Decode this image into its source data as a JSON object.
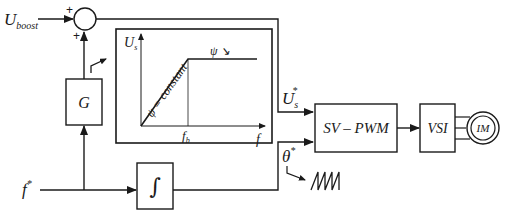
{
  "diagram": {
    "inputs": {
      "u_boost": {
        "main": "U",
        "sub": "boost"
      },
      "f_ref": {
        "main": "f",
        "sup": "*"
      }
    },
    "sum_signs": {
      "top": "+",
      "left": "+"
    },
    "blocks": {
      "gain": "G",
      "integrator": "∫",
      "svpwm": "SV – PWM",
      "vsi": "VSI",
      "motor": "IM"
    },
    "signals": {
      "us_ref": {
        "main": "U",
        "sub": "s",
        "sup": "*"
      },
      "theta_ref": {
        "main": "θ",
        "sup": "*"
      }
    },
    "vf_curve": {
      "y_axis": {
        "main": "U",
        "sub": "s"
      },
      "x_axis": "f",
      "knee": {
        "main": "f",
        "sub": "b"
      },
      "slope_label": "ψ = constant",
      "flat_label": "ψ ↘"
    },
    "colors": {
      "line": "#1a1a1a",
      "background": "#ffffff"
    }
  }
}
